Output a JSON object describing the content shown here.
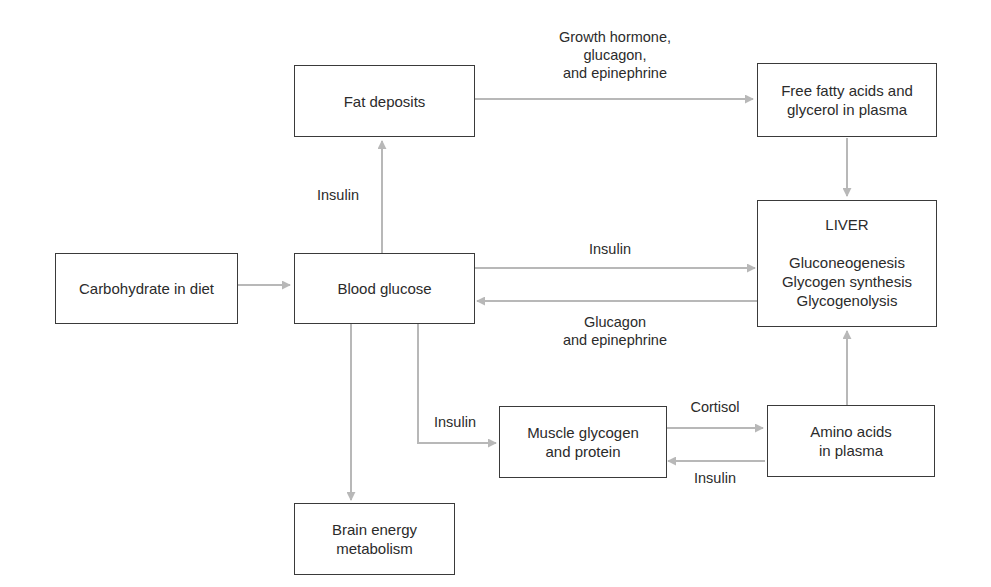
{
  "diagram": {
    "colors": {
      "edge": "#b8b8b8",
      "box_border": "#3a3a3a",
      "text": "#2b2b2b"
    },
    "nodes": {
      "fat": {
        "lines": [
          "Fat deposits"
        ]
      },
      "ffa": {
        "lines": [
          "Free fatty acids and",
          "glycerol in plasma"
        ]
      },
      "carb": {
        "lines": [
          "Carbohydrate in diet"
        ]
      },
      "blood": {
        "lines": [
          "Blood glucose"
        ]
      },
      "liver": {
        "title": "LIVER",
        "lines": [
          "Gluconeogenesis",
          "Glycogen synthesis",
          "Glycogenolysis"
        ]
      },
      "muscle": {
        "lines": [
          "Muscle glycogen",
          "and protein"
        ]
      },
      "amino": {
        "lines": [
          "Amino acids",
          "in plasma"
        ]
      },
      "brain": {
        "lines": [
          "Brain energy",
          "metabolism"
        ]
      }
    },
    "edge_labels": {
      "fat_to_ffa": [
        "Growth hormone,",
        "glucagon,",
        "and epinephrine"
      ],
      "blood_to_fat": [
        "Insulin"
      ],
      "blood_to_liver": [
        "Insulin"
      ],
      "liver_to_blood": [
        "Glucagon",
        "and epinephrine"
      ],
      "blood_to_muscle": [
        "Insulin"
      ],
      "muscle_to_amino": [
        "Cortisol"
      ],
      "amino_to_muscle": [
        "Insulin"
      ]
    }
  }
}
